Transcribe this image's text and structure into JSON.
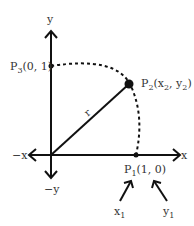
{
  "diagram": {
    "axes": {
      "x_pos_label": "x",
      "x_neg_label": "−x",
      "y_pos_label": "y",
      "y_neg_label": "−y"
    },
    "points": {
      "p1": {
        "name": "P",
        "sub": "1",
        "coords": "(1, 0)"
      },
      "p2": {
        "name": "P",
        "sub": "2",
        "open": "(x",
        "sub_x": "2",
        "mid": ", y",
        "sub_y": "2",
        "close": ")"
      },
      "p3": {
        "name": "P",
        "sub": "3",
        "coords": "(0, 1)"
      }
    },
    "radius_label": "r",
    "arrows": {
      "x1": {
        "name": "x",
        "sub": "1"
      },
      "y1": {
        "name": "y",
        "sub": "1"
      }
    }
  }
}
